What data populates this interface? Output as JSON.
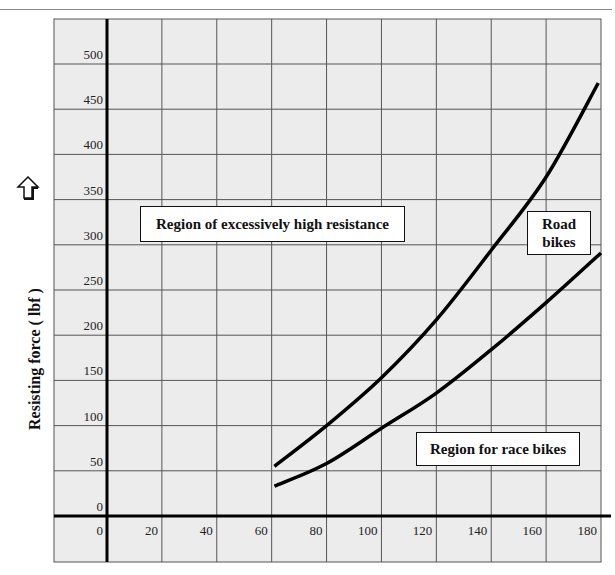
{
  "chart_data": {
    "type": "line",
    "title": "",
    "xlabel": "",
    "ylabel": "Resisting force ( lbf )",
    "xlim": [
      0,
      180
    ],
    "ylim": [
      0,
      500
    ],
    "x_ticks": [
      0,
      20,
      40,
      60,
      80,
      100,
      120,
      140,
      160,
      180
    ],
    "y_ticks": [
      0,
      50,
      100,
      150,
      200,
      250,
      300,
      350,
      400,
      450,
      500
    ],
    "grid": true,
    "series": [
      {
        "name": "Road bikes (upper boundary)",
        "x": [
          61,
          80,
          100,
          120,
          140,
          160,
          179
        ],
        "values": [
          55,
          100,
          153,
          217,
          294,
          375,
          479
        ]
      },
      {
        "name": "Race bikes (lower boundary)",
        "x": [
          61,
          80,
          100,
          120,
          140,
          160,
          180
        ],
        "values": [
          33,
          58,
          97,
          136,
          184,
          236,
          291
        ]
      }
    ],
    "annotations": [
      "Region of excessively high resistance",
      "Road bikes",
      "Region for race bikes"
    ]
  },
  "axis": {
    "ylabel": "Resisting force ( lbf )",
    "x_tick_labels": [
      "0",
      "20",
      "40",
      "60",
      "80",
      "100",
      "120",
      "140",
      "160",
      "180"
    ],
    "y_tick_labels": [
      "0",
      "50",
      "100",
      "150",
      "200",
      "250",
      "300",
      "350",
      "400",
      "450",
      "500"
    ]
  },
  "labels": {
    "high_resistance": "Region of excessively high resistance",
    "road_bikes_line1": "Road",
    "road_bikes_line2": "bikes",
    "race_bikes": "Region for race bikes"
  },
  "colors": {
    "background": "#ececec",
    "grid": "#555555",
    "axis": "#000000",
    "curve": "#000000"
  }
}
